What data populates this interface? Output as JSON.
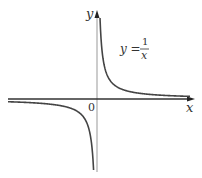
{
  "figure": {
    "x_axis_label": "x",
    "y_axis_label": "y",
    "origin_label": "0",
    "equation": {
      "lhs": "y =",
      "numerator": "1",
      "denominator": "x"
    }
  },
  "chart_data": {
    "type": "line",
    "title": "",
    "function": "y = 1/x",
    "xlabel": "x",
    "ylabel": "y",
    "grid": false,
    "branches": [
      "x > 0 (first quadrant)",
      "x < 0 (third quadrant)"
    ],
    "asymptotes": [
      "x = 0",
      "y = 0"
    ]
  },
  "colors": {
    "curve": "#444444",
    "axis": "#333333",
    "y_axis": "#888888"
  }
}
